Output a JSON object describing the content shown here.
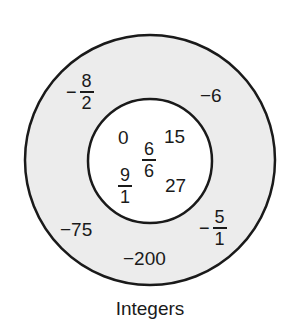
{
  "diagram": {
    "title": "Integers",
    "colors": {
      "outer_ring": "#ececec",
      "inner_circle": "#ffffff",
      "stroke": "#1a1a1a"
    },
    "inner_set": {
      "items": [
        "0",
        "15",
        "27"
      ],
      "fractions": [
        {
          "sign": "",
          "num": "6",
          "den": "6"
        },
        {
          "sign": "",
          "num": "9",
          "den": "1"
        }
      ]
    },
    "outer_set": {
      "items": [
        "-6",
        "-75",
        "-200"
      ],
      "fractions": [
        {
          "sign": "−",
          "num": "8",
          "den": "2"
        },
        {
          "sign": "−",
          "num": "5",
          "den": "1"
        }
      ]
    },
    "labels": {
      "zero": "0",
      "fifteen": "15",
      "twentyseven": "27",
      "neg6": "−6",
      "neg75": "−75",
      "neg200": "−200"
    }
  }
}
